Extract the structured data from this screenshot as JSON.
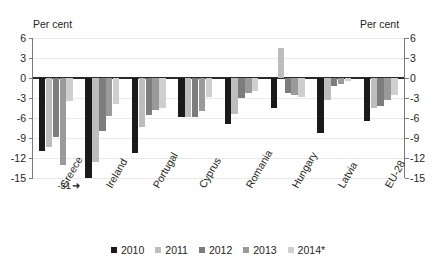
{
  "chart_data": {
    "type": "bar",
    "title": "",
    "subtitle": "",
    "xlabel": "",
    "ylabel": "Per cent",
    "ylabel_right": "Per cent",
    "ylim": [
      -15,
      6
    ],
    "yticks": [
      6,
      3,
      0,
      -3,
      -6,
      -9,
      -12,
      -15
    ],
    "ytick_labels": [
      "6",
      "3",
      "0",
      "-3",
      "-6",
      "-9",
      "-12",
      "-15"
    ],
    "grid": true,
    "legend_position": "bottom",
    "categories": [
      "Greece",
      "Ireland",
      "Portugal",
      "Cyprus",
      "Romania",
      "Hungary",
      "Latvia",
      "EU-28"
    ],
    "series": [
      {
        "name": "2010",
        "color": "#1a1a1a",
        "values": [
          -11.0,
          -31.0,
          -11.2,
          -5.8,
          -6.9,
          -4.5,
          -8.2,
          -6.4
        ],
        "clipped": [
          false,
          true,
          false,
          false,
          false,
          false,
          false,
          false
        ]
      },
      {
        "name": "2011",
        "color": "#bdbdbd",
        "values": [
          -10.3,
          -12.6,
          -7.4,
          -5.8,
          -5.4,
          4.5,
          -3.3,
          -4.5
        ],
        "clipped": [
          false,
          false,
          false,
          false,
          false,
          false,
          false,
          false
        ]
      },
      {
        "name": "2012",
        "color": "#7d7d7d",
        "values": [
          -8.9,
          -8.0,
          -5.6,
          -5.8,
          -3.0,
          -2.3,
          -1.2,
          -4.2
        ],
        "clipped": [
          false,
          false,
          false,
          false,
          false,
          false,
          false,
          false
        ]
      },
      {
        "name": "2013",
        "color": "#9a9a9a",
        "values": [
          -13.0,
          -5.7,
          -4.8,
          -4.9,
          -2.2,
          -2.5,
          -0.9,
          -3.3
        ],
        "clipped": [
          false,
          false,
          false,
          false,
          false,
          false,
          false,
          false
        ]
      },
      {
        "name": "2014*",
        "color": "#cfcfcf",
        "values": [
          -3.5,
          -3.9,
          -4.5,
          -2.9,
          -1.9,
          -2.9,
          -0.5,
          -2.6
        ],
        "clipped": [
          false,
          false,
          false,
          false,
          false,
          false,
          false,
          false
        ]
      }
    ],
    "annotations": [
      {
        "text": "-31",
        "arrow": "➜",
        "target_category": "Ireland",
        "target_series": "2010",
        "value": -31
      }
    ]
  },
  "legend": {
    "items": [
      {
        "label": "2010",
        "color": "#1a1a1a"
      },
      {
        "label": "2011",
        "color": "#bdbdbd"
      },
      {
        "label": "2012",
        "color": "#7d7d7d"
      },
      {
        "label": "2013",
        "color": "#9a9a9a"
      },
      {
        "label": "2014*",
        "color": "#cfcfcf"
      }
    ]
  },
  "axis": {
    "left_title": "Per cent",
    "right_title": "Per cent"
  }
}
